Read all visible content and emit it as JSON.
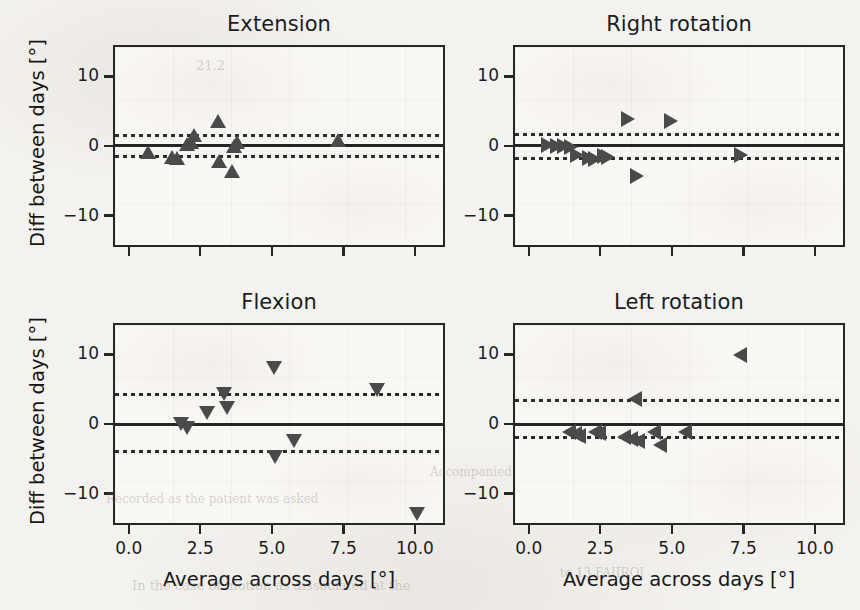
{
  "figure": {
    "background_color": "#f4f2ee",
    "axes_face_color": "#faf8f5",
    "marker_color": "#4a4a4a",
    "line_color": "#262626",
    "axis_name_y": "Diff between days [°]",
    "axis_name_x": "Average across days [°]",
    "y_ticks": [
      "10",
      "0",
      "−10"
    ],
    "x_ticks": [
      "0.0",
      "2.5",
      "5.0",
      "7.5",
      "10.0"
    ],
    "ghost_text": [
      {
        "text": "21.2",
        "x": 196,
        "y": 58,
        "size": 13
      },
      {
        "text": "In the case of motion as dissociated at the",
        "x": 132,
        "y": 578,
        "size": 13
      },
      {
        "text": "Accompanied",
        "x": 430,
        "y": 465,
        "size": 12
      },
      {
        "text": "Recorded as the patient was asked",
        "x": 106,
        "y": 492,
        "size": 12
      },
      {
        "text": "to 13 FAIIROI",
        "x": 560,
        "y": 566,
        "size": 12
      }
    ]
  },
  "chart_data": [
    {
      "type": "scatter",
      "title": "Extension",
      "panel": "top-left",
      "marker": "triangle-up",
      "xlabel": "Average across days [°]",
      "ylabel": "Diff between days [°]",
      "xlim": [
        -0.55,
        11.05
      ],
      "ylim": [
        -14.5,
        14.5
      ],
      "x_ticks": [
        0.0,
        2.5,
        5.0,
        7.5,
        10.0
      ],
      "y_ticks": [
        10,
        0,
        -10
      ],
      "grid": false,
      "mean": 0.35,
      "loa_upper": 1.8,
      "loa_lower": -1.15,
      "points": [
        {
          "x": 0.62,
          "y": -0.6
        },
        {
          "x": 1.45,
          "y": -1.3
        },
        {
          "x": 1.62,
          "y": -1.4
        },
        {
          "x": 1.98,
          "y": 0.6
        },
        {
          "x": 2.12,
          "y": 0.9
        },
        {
          "x": 2.2,
          "y": 1.9
        },
        {
          "x": 3.05,
          "y": 3.9
        },
        {
          "x": 3.08,
          "y": -1.9
        },
        {
          "x": 3.55,
          "y": -3.3
        },
        {
          "x": 3.62,
          "y": 0.3
        },
        {
          "x": 3.7,
          "y": 0.8
        },
        {
          "x": 7.25,
          "y": 1.2
        }
      ]
    },
    {
      "type": "scatter",
      "title": "Right rotation",
      "panel": "top-right",
      "marker": "triangle-right",
      "xlabel": "Average across days [°]",
      "ylabel": "Diff between days [°]",
      "xlim": [
        -0.55,
        11.05
      ],
      "ylim": [
        -14.5,
        14.5
      ],
      "x_ticks": [
        0.0,
        2.5,
        5.0,
        7.5,
        10.0
      ],
      "y_ticks": [
        10,
        0,
        -10
      ],
      "grid": false,
      "mean": 0.3,
      "loa_upper": 2.0,
      "loa_lower": -1.5,
      "points": [
        {
          "x": 0.6,
          "y": 0.4
        },
        {
          "x": 0.9,
          "y": 0.3
        },
        {
          "x": 1.15,
          "y": 0.25
        },
        {
          "x": 1.4,
          "y": 0.1
        },
        {
          "x": 1.62,
          "y": -1.0
        },
        {
          "x": 2.05,
          "y": -1.5
        },
        {
          "x": 2.25,
          "y": -1.6
        },
        {
          "x": 2.55,
          "y": -1.1
        },
        {
          "x": 2.7,
          "y": -1.3
        },
        {
          "x": 3.4,
          "y": 4.1
        },
        {
          "x": 3.7,
          "y": -4.0
        },
        {
          "x": 4.9,
          "y": 3.9
        },
        {
          "x": 7.35,
          "y": -1.0
        }
      ]
    },
    {
      "type": "scatter",
      "title": "Flexion",
      "panel": "bottom-left",
      "marker": "triangle-down",
      "xlabel": "Average across days [°]",
      "ylabel": "Diff between days [°]",
      "xlim": [
        -0.55,
        11.05
      ],
      "ylim": [
        -14.5,
        14.5
      ],
      "x_ticks": [
        0.0,
        2.5,
        5.0,
        7.5,
        10.0
      ],
      "y_ticks": [
        10,
        0,
        -10
      ],
      "grid": false,
      "mean": 0.25,
      "loa_upper": 4.5,
      "loa_lower": -3.7,
      "points": [
        {
          "x": 1.75,
          "y": 0.35
        },
        {
          "x": 1.95,
          "y": -0.35
        },
        {
          "x": 2.65,
          "y": 1.9
        },
        {
          "x": 3.25,
          "y": 4.6
        },
        {
          "x": 3.35,
          "y": 2.6
        },
        {
          "x": 5.0,
          "y": 8.3
        },
        {
          "x": 5.05,
          "y": -4.4
        },
        {
          "x": 5.7,
          "y": -2.2
        },
        {
          "x": 8.6,
          "y": 5.2
        },
        {
          "x": 10.0,
          "y": -12.7
        }
      ]
    },
    {
      "type": "scatter",
      "title": "Left rotation",
      "panel": "bottom-right",
      "marker": "triangle-left",
      "xlabel": "Average across days [°]",
      "ylabel": "Diff between days [°]",
      "xlim": [
        -0.55,
        11.05
      ],
      "ylim": [
        -14.5,
        14.5
      ],
      "x_ticks": [
        0.0,
        2.5,
        5.0,
        7.5,
        10.0
      ],
      "y_ticks": [
        10,
        0,
        -10
      ],
      "grid": false,
      "mean": 0.25,
      "loa_upper": 3.7,
      "loa_lower": -1.6,
      "points": [
        {
          "x": 1.35,
          "y": -0.9
        },
        {
          "x": 1.55,
          "y": -1.2
        },
        {
          "x": 1.7,
          "y": -1.5
        },
        {
          "x": 2.25,
          "y": -0.9
        },
        {
          "x": 2.4,
          "y": -1.0
        },
        {
          "x": 3.25,
          "y": -1.6
        },
        {
          "x": 3.5,
          "y": -1.9
        },
        {
          "x": 3.65,
          "y": 3.9
        },
        {
          "x": 3.75,
          "y": -2.1
        },
        {
          "x": 4.3,
          "y": -0.9
        },
        {
          "x": 4.5,
          "y": -2.7
        },
        {
          "x": 5.4,
          "y": -0.9
        },
        {
          "x": 7.3,
          "y": 10.2
        }
      ]
    }
  ]
}
